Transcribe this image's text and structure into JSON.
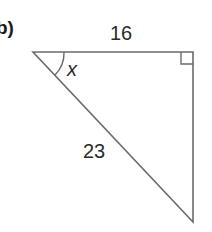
{
  "question_label": "b)",
  "triangle": {
    "opposite_side": "16",
    "hypotenuse": "23",
    "angle_label": "x",
    "right_angle_position": "top-right",
    "stroke_color": "#6b6b6b"
  }
}
